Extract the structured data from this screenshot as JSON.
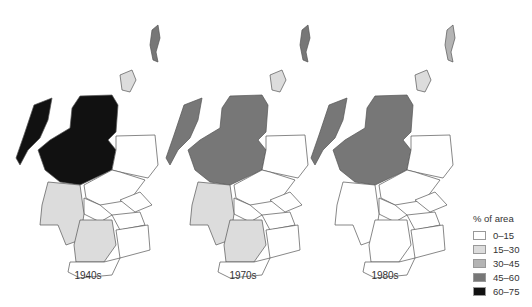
{
  "maps": [
    {
      "label": "1940s",
      "regions": {
        "shetland": "45-60",
        "orkney": "15-30",
        "western_isles": "60-75",
        "highland": "60-75",
        "grampian": "0-15",
        "tayside": "0-15",
        "fife": "0-15",
        "central": "0-15",
        "argyll": "15-30",
        "strathclyde_south": "15-30",
        "lothian": "0-15",
        "borders": "0-15",
        "dumfries_galloway": "0-15"
      }
    },
    {
      "label": "1970s",
      "regions": {
        "shetland": "45-60",
        "orkney": "15-30",
        "western_isles": "45-60",
        "highland": "45-60",
        "grampian": "0-15",
        "tayside": "0-15",
        "fife": "0-15",
        "central": "0-15",
        "argyll": "15-30",
        "strathclyde_south": "15-30",
        "lothian": "0-15",
        "borders": "0-15",
        "dumfries_galloway": "0-15"
      }
    },
    {
      "label": "1980s",
      "regions": {
        "shetland": "30-45",
        "orkney": "15-30",
        "western_isles": "45-60",
        "highland": "45-60",
        "grampian": "0-15",
        "tayside": "0-15",
        "fife": "0-15",
        "central": "0-15",
        "argyll": "0-15",
        "strathclyde_south": "0-15",
        "lothian": "0-15",
        "borders": "0-15",
        "dumfries_galloway": "0-15"
      }
    }
  ],
  "legend": {
    "title": "% of area",
    "items": [
      {
        "label": "0–15",
        "color": "#ffffff"
      },
      {
        "label": "15–30",
        "color": "#dcdcdc"
      },
      {
        "label": "30–45",
        "color": "#b4b4b4"
      },
      {
        "label": "45–60",
        "color": "#777777"
      },
      {
        "label": "60–75",
        "color": "#111111"
      }
    ]
  }
}
